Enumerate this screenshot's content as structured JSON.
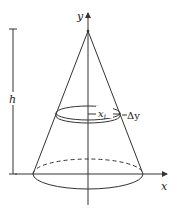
{
  "diagram": {
    "labels": {
      "y_axis": "y",
      "x_axis": "x",
      "height": "h",
      "radius": "x",
      "radius_sub": "i",
      "thickness": "Δy"
    },
    "colors": {
      "stroke": "#333333",
      "background": "#ffffff"
    }
  }
}
